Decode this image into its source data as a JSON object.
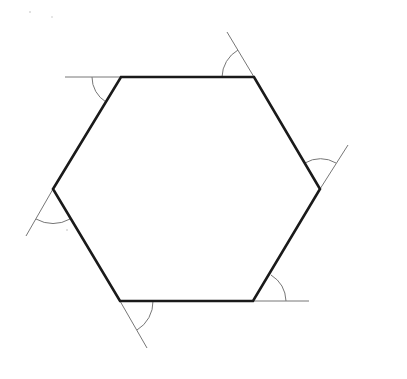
{
  "diagram": {
    "type": "geometry",
    "colors": {
      "background": "#ffffff",
      "hexagon_stroke": "#1a1a1a",
      "extension_stroke": "#777777",
      "arc_stroke": "#777777"
    },
    "hexagon": {
      "vertices": [
        {
          "name": "top-left",
          "x": 121,
          "y": 77
        },
        {
          "name": "top-right",
          "x": 254,
          "y": 77
        },
        {
          "name": "right",
          "x": 320,
          "y": 189
        },
        {
          "name": "bottom-right",
          "x": 253,
          "y": 301
        },
        {
          "name": "bottom-left",
          "x": 120,
          "y": 301
        },
        {
          "name": "left",
          "x": 53,
          "y": 189
        }
      ]
    },
    "extensions": [
      {
        "from": [
          121,
          77
        ],
        "to": [
          65,
          77
        ]
      },
      {
        "from": [
          254,
          77
        ],
        "to": [
          227,
          32
        ]
      },
      {
        "from": [
          320,
          189
        ],
        "to": [
          348,
          145
        ]
      },
      {
        "from": [
          253,
          301
        ],
        "to": [
          309,
          301
        ]
      },
      {
        "from": [
          120,
          301
        ],
        "to": [
          147,
          348
        ]
      },
      {
        "from": [
          53,
          189
        ],
        "to": [
          26,
          236
        ]
      }
    ],
    "exterior_angle_arcs": [
      {
        "vertex": "top-left",
        "path": "M 92 77 A 29 29 0 0 0 106 102"
      },
      {
        "vertex": "top-right",
        "path": "M 222 77 A 32 32 0 0 1 238 50"
      },
      {
        "vertex": "right",
        "path": "M 305 163 A 30 30 0 0 1 336 163"
      },
      {
        "vertex": "bottom-right",
        "path": "M 271 275 A 32 32 0 0 1 286 301"
      },
      {
        "vertex": "bottom-left",
        "path": "M 153 301 A 33 33 0 0 1 137 330"
      },
      {
        "vertex": "left",
        "path": "M 36 219 A 34 34 0 0 0 70 219"
      }
    ]
  }
}
